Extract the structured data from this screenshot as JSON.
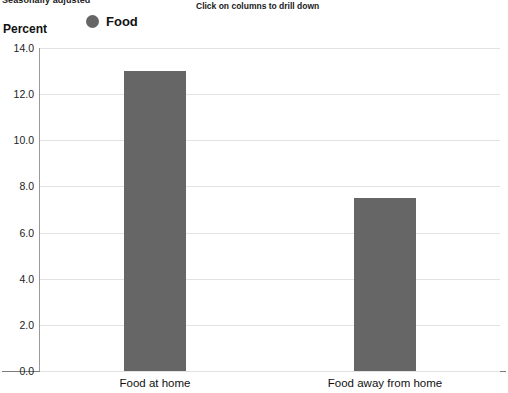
{
  "header": {
    "subtitle": "Seasonally adjusted",
    "drill_hint": "Click on columns to drill down"
  },
  "legend": {
    "position": "top-left",
    "entries": [
      {
        "label": "Food",
        "color": "#666666",
        "marker": "circle"
      }
    ]
  },
  "colors": {
    "bar": "#666666",
    "gridline": "#e2e2e2",
    "axis": "#7d7d7d",
    "text": "#111111",
    "background": "#ffffff"
  },
  "icons": {
    "legend_marker": "circle-marker-icon"
  },
  "chart_data": {
    "type": "bar",
    "title": "",
    "subtitle": "Seasonally adjusted",
    "categories": [
      "Food at home",
      "Food away from home"
    ],
    "series": [
      {
        "name": "Food",
        "values": [
          13.0,
          7.5
        ],
        "color": "#666666"
      }
    ],
    "values": [
      13.0,
      7.5
    ],
    "xlabel": "",
    "ylabel": "Percent",
    "ylim": [
      0.0,
      14.0
    ],
    "ytick_step": 2.0,
    "yticks": [
      "0.0",
      "2.0",
      "4.0",
      "6.0",
      "8.0",
      "10.0",
      "12.0",
      "14.0"
    ],
    "ytick_values": [
      0.0,
      2.0,
      4.0,
      6.0,
      8.0,
      10.0,
      12.0,
      14.0
    ],
    "grid": true,
    "grid_axis": "y",
    "legend": true,
    "legend_position": "top-left",
    "annotations": [
      "Click on columns to drill down"
    ]
  }
}
